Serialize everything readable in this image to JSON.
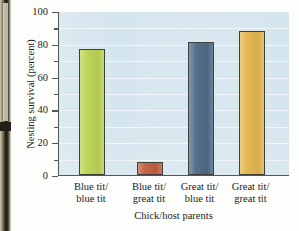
{
  "chart_data": {
    "type": "bar",
    "title": "",
    "xlabel": "Chick/host parents",
    "ylabel": "Nesting survival (percent)",
    "categories": [
      "Blue tit/ blue tit",
      "Blue tit/ great tit",
      "Great tit/ blue tit",
      "Great tit/ great tit"
    ],
    "category_lines": [
      [
        "Blue tit/",
        "blue tit"
      ],
      [
        "Blue tit/",
        "great tit"
      ],
      [
        "Great tit/",
        "blue tit"
      ],
      [
        "Great tit/",
        "great tit"
      ]
    ],
    "values": [
      77,
      8,
      81,
      88
    ],
    "bar_colors": [
      "#bcd455",
      "#c0603f",
      "#4f6a87",
      "#e4b54e"
    ],
    "ylim": [
      0,
      100
    ],
    "yticks": [
      0,
      20,
      40,
      60,
      80,
      100
    ],
    "ytick_labels": [
      "0",
      "20",
      "40",
      "60",
      "80",
      "100"
    ],
    "yminor_ticks": [
      10,
      30,
      50,
      70,
      90
    ],
    "grid": true,
    "grid_step": 10,
    "legend": "none",
    "plot_background": "#d6e6ee",
    "axis_color": "#555555"
  },
  "axis": {
    "y_title": "Nesting survival (percent)",
    "x_title": "Chick/host parents"
  }
}
